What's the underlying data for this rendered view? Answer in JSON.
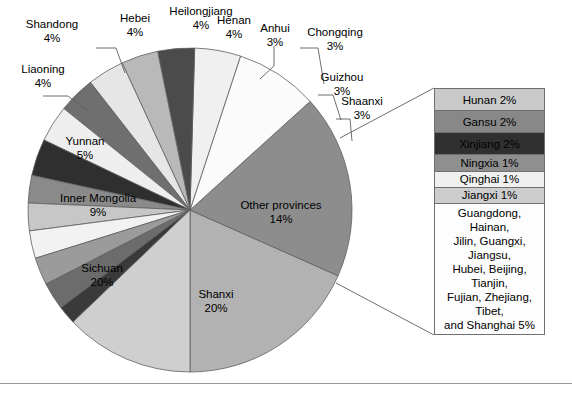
{
  "chart_data": {
    "type": "pie",
    "title": "",
    "xlabel": "",
    "ylabel": "",
    "legend_position": "callout-box-right",
    "units": "percent",
    "start_angle_deg": -90,
    "direction": "counterclockwise",
    "categories": [
      "Shanxi",
      "Sichuan",
      "Inner Mongolia",
      "Yunnan",
      "Liaoning",
      "Shandong",
      "Hebei",
      "Heilongjiang",
      "Henan",
      "Anhui",
      "Chongqing",
      "Guizhou",
      "Shaanxi",
      "Other provinces"
    ],
    "values": [
      20,
      20,
      9,
      5,
      4,
      4,
      4,
      4,
      4,
      3,
      3,
      3,
      3,
      14
    ],
    "colors": [
      "#b5b5b5",
      "#8e8e8e",
      "#fbfbfb",
      "#efefef",
      "#4a4a4a",
      "#b8b8b8",
      "#e8e8e8",
      "#6e6e6e",
      "#efefef",
      "#333333",
      "#8a8a8a",
      "#c5c5c5",
      "#efefef",
      "#9a9a9a",
      "#6d6d6d",
      "#3d3d3d",
      "#cfcfcf"
    ],
    "labels_text": [
      "Shanxi 20%",
      "Sichuan 20%",
      "Inner Mongolia 9%",
      "Yunnan 5%",
      "Liaoning 4%",
      "Shandong 4%",
      "Hebei 4%",
      "Heilongjiang 4%",
      "Henan 4%",
      "Anhui 3%",
      "Chongqing 3%",
      "Guizhou 3%",
      "Shaanxi 3%",
      "Other provinces 14%"
    ],
    "breakout": {
      "parent": "Other provinces",
      "parent_value": 14,
      "items": [
        {
          "label": "Hunan 2%",
          "name": "Hunan",
          "value": 2
        },
        {
          "label": "Gansu 2%",
          "name": "Gansu",
          "value": 2
        },
        {
          "label": "Xinjiang 2%",
          "name": "Xinjiang",
          "value": 2
        },
        {
          "label": "Ningxia 1%",
          "name": "Ningxia",
          "value": 1
        },
        {
          "label": "Qinghai 1%",
          "name": "Qinghai",
          "value": 1
        },
        {
          "label": "Jiangxi 1%",
          "name": "Jiangxi",
          "value": 1
        },
        {
          "label": "Guangdong, Hainan, Jilin, Guangxi, Jiangsu, Hubei, Beijing, Tianjin, Fujian, Zhejiang, Tibet, and Shanghai 5%",
          "name": "Other combined",
          "value": 5
        }
      ]
    }
  },
  "pie": {
    "slices": [
      {
        "name": "shanxi",
        "label": "Shanxi",
        "pct": "20%",
        "value": 20,
        "color": "#b2b2b2"
      },
      {
        "name": "sichuan",
        "label": "Sichuan",
        "pct": "20%",
        "value": 20,
        "color": "#8d8d8d"
      },
      {
        "name": "inner-mongolia",
        "label": "Inner Mongolia",
        "pct": "9%",
        "value": 9,
        "color": "#fbfbfb"
      },
      {
        "name": "yunnan",
        "label": "Yunnan",
        "pct": "5%",
        "value": 5,
        "color": "#f0f0f0"
      },
      {
        "name": "liaoning",
        "label": "Liaoning",
        "pct": "4%",
        "value": 4,
        "color": "#4b4b4b"
      },
      {
        "name": "shandong",
        "label": "Shandong",
        "pct": "4%",
        "value": 4,
        "color": "#b9b9b9"
      },
      {
        "name": "hebei",
        "label": "Hebei",
        "pct": "4%",
        "value": 4,
        "color": "#e6e6e6"
      },
      {
        "name": "heilongjiang",
        "label": "Heilongjiang",
        "pct": "4%",
        "value": 4,
        "color": "#6f6f6f"
      },
      {
        "name": "henan-light",
        "label": "Henan",
        "pct": "4%",
        "value": 4,
        "color": "#eeeeee"
      },
      {
        "name": "henan-dark",
        "label": "Henan",
        "pct": "4%",
        "value": 4,
        "color": "#2f2f2f"
      },
      {
        "name": "anhui",
        "label": "Anhui",
        "pct": "3%",
        "value": 3,
        "color": "#8a8a8a"
      },
      {
        "name": "chongqing",
        "label": "Chongqing",
        "pct": "3%",
        "value": 3,
        "color": "#c7c7c7"
      },
      {
        "name": "guizhou",
        "label": "Guizhou",
        "pct": "3%",
        "value": 3,
        "color": "#f2f2f2"
      },
      {
        "name": "shaanxi-mid",
        "label": "Shaanxi",
        "pct": "3%",
        "value": 3,
        "color": "#9b9b9b"
      },
      {
        "name": "shaanxi-dark",
        "label": "Shaanxi",
        "pct": "3%",
        "value": 3,
        "color": "#6c6c6c"
      },
      {
        "name": "small-dark",
        "label": "",
        "pct": "",
        "value": 2,
        "color": "#3a3a3a"
      },
      {
        "name": "other-provinces",
        "label": "Other provinces",
        "pct": "14%",
        "value": 14,
        "color": "#cfcfcf"
      }
    ],
    "outer_labels": [
      {
        "name": "liaoning",
        "line1": "Liaoning",
        "line2": "4%"
      },
      {
        "name": "shandong",
        "line1": "Shandong",
        "line2": "4%"
      },
      {
        "name": "hebei",
        "line1": "Hebei",
        "line2": "4%"
      },
      {
        "name": "heilongjiang",
        "line1": "Heilongjiang",
        "line2": "4%"
      },
      {
        "name": "henan",
        "line1": "Henan",
        "line2": "4%"
      },
      {
        "name": "anhui",
        "line1": "Anhui",
        "line2": "3%"
      },
      {
        "name": "chongqing",
        "line1": "Chongqing",
        "line2": "3%"
      },
      {
        "name": "guizhou",
        "line1": "Guizhou",
        "line2": "3%"
      },
      {
        "name": "shaanxi",
        "line1": "Shaanxi",
        "line2": "3%"
      }
    ],
    "inner_labels": [
      {
        "name": "yunnan",
        "line1": "Yunnan",
        "line2": "5%"
      },
      {
        "name": "inner-mongolia",
        "line1": "Inner Mongolia",
        "line2": "9%"
      },
      {
        "name": "sichuan",
        "line1": "Sichuan",
        "line2": "20%"
      },
      {
        "name": "shanxi",
        "line1": "Shanxi",
        "line2": "20%"
      },
      {
        "name": "other-provinces",
        "line1": "Other provinces",
        "line2": "14%"
      }
    ]
  },
  "callout": {
    "cells": [
      {
        "name": "hunan",
        "text": "Hunan 2%",
        "color": "#c9c9c9",
        "text_color": "#000000"
      },
      {
        "name": "gansu",
        "text": "Gansu 2%",
        "color": "#888888",
        "text_color": "#000000"
      },
      {
        "name": "xinjiang",
        "text": "Xinjiang 2%",
        "color": "#303030",
        "text_color": "#000000"
      },
      {
        "name": "ningxia",
        "text": "Ningxia 1%",
        "color": "#8f8f8f",
        "text_color": "#000000"
      },
      {
        "name": "qinghai",
        "text": "Qinghai 1%",
        "color": "#f0f0f0",
        "text_color": "#000000"
      },
      {
        "name": "jiangxi",
        "text": "Jiangxi 1%",
        "color": "#cdcdcd",
        "text_color": "#000000"
      }
    ],
    "note": {
      "name": "other-combined",
      "line1": "Guangdong, Hainan,",
      "line2": "Jilin, Guangxi, Jiangsu,",
      "line3": "Hubei, Beijing, Tianjin,",
      "line4": "Fujian, Zhejiang, Tibet,",
      "line5": "and Shanghai 5%",
      "color": "#fdfdfd"
    }
  },
  "style": {
    "stroke": "#5f5f5f",
    "background": "#ffffff",
    "rule_color": "#9a9a9a"
  }
}
